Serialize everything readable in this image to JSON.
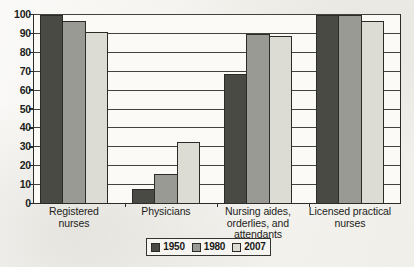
{
  "chart_data": {
    "type": "bar",
    "title": "",
    "subtitle": "",
    "xlabel": "",
    "ylabel": "",
    "ylim": [
      0,
      100
    ],
    "ytick_step": 10,
    "yticks": [
      "100",
      "90",
      "80",
      "70",
      "60",
      "50",
      "40",
      "30",
      "20",
      "10",
      "0"
    ],
    "grid": "horizontal",
    "legend_position": "bottom-center",
    "categories": [
      "Registered nurses",
      "Physicians",
      "Nursing aides, orderlies, and attendants",
      "Licensed practical nurses"
    ],
    "category_lines": [
      [
        "Registered",
        "nurses"
      ],
      [
        "Physicians"
      ],
      [
        "Nursing aides,",
        "orderlies, and",
        "attendants"
      ],
      [
        "Licensed practical",
        "nurses"
      ]
    ],
    "series": [
      {
        "name": "1950",
        "color": "#4a4a45",
        "values": [
          99,
          7,
          68,
          99
        ]
      },
      {
        "name": "1980",
        "color": "#9a9a95",
        "values": [
          96,
          15,
          89,
          99
        ]
      },
      {
        "name": "2007",
        "color": "#dcdcd5",
        "values": [
          90,
          32,
          88,
          96
        ]
      }
    ]
  },
  "legend": {
    "items": [
      {
        "label": "1950",
        "color": "#4a4a45"
      },
      {
        "label": "1980",
        "color": "#9a9a95"
      },
      {
        "label": "2007",
        "color": "#dcdcd5"
      }
    ]
  },
  "axis": {
    "bar_outline_color": "#2b2b28",
    "grid_color": "#43433e",
    "axis_color": "#2b2b28"
  }
}
